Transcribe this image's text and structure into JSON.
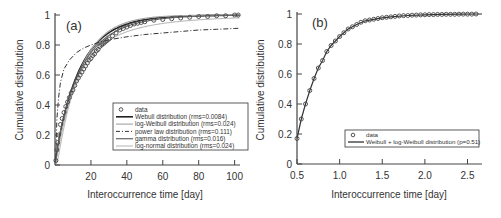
{
  "chart_data": [
    {
      "panel": "(a)",
      "type": "line",
      "xlabel": "Interoccurrence time [day]",
      "ylabel": "Cumulative distribution",
      "xlim": [
        0,
        103
      ],
      "ylim": [
        0,
        1
      ],
      "xticks": [
        20,
        40,
        60,
        80,
        100
      ],
      "yticks": [
        0,
        0.2,
        0.4,
        0.6,
        0.8,
        1
      ],
      "ytick_labels": [
        "0",
        "0.2",
        "0.4",
        "0.6",
        "0.8",
        "1"
      ],
      "grid": false,
      "legend_position": "lower right",
      "legend": [
        {
          "label": "data",
          "style": "circle"
        },
        {
          "label": "Webull distribution (rms=0.0084)",
          "style": "solid-dark"
        },
        {
          "label": "log-Weibull distribution (rms=0.024)",
          "style": "solid-light"
        },
        {
          "label": "power law distribution (rms=0.111)",
          "style": "dashdot"
        },
        {
          "label": "gamma distribution (rms=0.016)",
          "style": "solid-mid"
        },
        {
          "label": "log-normal distribution (rms=0.024)",
          "style": "solid-pale"
        }
      ],
      "series": [
        {
          "name": "data",
          "x": [
            0.5,
            1,
            1.5,
            2,
            3,
            4,
            5,
            6,
            7,
            8,
            9,
            10,
            11,
            12,
            13,
            14,
            15,
            16,
            17,
            18,
            19,
            20,
            21,
            22,
            23,
            24,
            25,
            26,
            27,
            28,
            29,
            30,
            32,
            34,
            36,
            38,
            40,
            42,
            44,
            46,
            48,
            50,
            55,
            60,
            65,
            70,
            75,
            80,
            85,
            90,
            95,
            100,
            102
          ],
          "y": [
            0.03,
            0.1,
            0.15,
            0.2,
            0.27,
            0.31,
            0.35,
            0.39,
            0.42,
            0.45,
            0.48,
            0.5,
            0.53,
            0.56,
            0.58,
            0.6,
            0.62,
            0.64,
            0.66,
            0.68,
            0.7,
            0.71,
            0.73,
            0.74,
            0.76,
            0.77,
            0.79,
            0.8,
            0.81,
            0.82,
            0.83,
            0.84,
            0.86,
            0.88,
            0.9,
            0.91,
            0.92,
            0.93,
            0.94,
            0.945,
            0.95,
            0.955,
            0.965,
            0.97,
            0.975,
            0.98,
            0.985,
            0.99,
            0.99,
            0.995,
            0.995,
            1.0,
            1.0
          ]
        },
        {
          "name": "Webull distribution (rms=0.0084)",
          "shape": 0.95,
          "scale": 13.5
        },
        {
          "name": "log-Weibull distribution (rms=0.024)",
          "shape": 1.05,
          "scale": 14.0
        },
        {
          "name": "power law distribution (rms=0.111)",
          "x": [
            0.5,
            1,
            2,
            3,
            5,
            8,
            12,
            16,
            20,
            25,
            30,
            40,
            50,
            60,
            70,
            80,
            90,
            100,
            103
          ],
          "y": [
            0.05,
            0.3,
            0.45,
            0.55,
            0.64,
            0.7,
            0.75,
            0.78,
            0.8,
            0.82,
            0.835,
            0.855,
            0.87,
            0.88,
            0.89,
            0.9,
            0.905,
            0.91,
            0.912
          ]
        },
        {
          "name": "gamma distribution (rms=0.016)",
          "shape": 0.9,
          "scale": 15.0
        },
        {
          "name": "log-normal distribution (rms=0.024)",
          "mu": 2.35,
          "sigma": 1.1
        }
      ]
    },
    {
      "panel": "(b)",
      "type": "line",
      "xlabel": "Interoccurrence time [day]",
      "ylabel": "Cumulative distribution",
      "xlim": [
        0.5,
        2.67
      ],
      "ylim": [
        0,
        1
      ],
      "xticks": [
        0.5,
        1.0,
        1.5,
        2.0,
        2.5
      ],
      "xtick_labels": [
        "0.5",
        "1.0",
        "1.5",
        "2.0",
        "2.5"
      ],
      "yticks": [
        0,
        0.2,
        0.4,
        0.6,
        0.8,
        1
      ],
      "ytick_labels": [
        "0",
        "0.2",
        "0.4",
        "0.6",
        "0.8",
        "1"
      ],
      "grid": false,
      "legend_position": "lower right",
      "legend": [
        {
          "label": "data",
          "style": "circle"
        },
        {
          "label": "Weibull + log-Weibull distribution (p=0.51)",
          "style": "solid-dark"
        }
      ],
      "series": [
        {
          "name": "data",
          "x": [
            0.5,
            0.55,
            0.6,
            0.65,
            0.7,
            0.75,
            0.8,
            0.85,
            0.9,
            0.95,
            1.0,
            1.05,
            1.1,
            1.15,
            1.2,
            1.25,
            1.3,
            1.35,
            1.4,
            1.45,
            1.5,
            1.55,
            1.6,
            1.65,
            1.7,
            1.75,
            1.8,
            1.85,
            1.9,
            1.95,
            2.0,
            2.05,
            2.1,
            2.15,
            2.2,
            2.25,
            2.3,
            2.35,
            2.4,
            2.45,
            2.5,
            2.55,
            2.6
          ],
          "y": [
            0.17,
            0.3,
            0.4,
            0.49,
            0.57,
            0.64,
            0.69,
            0.75,
            0.79,
            0.82,
            0.85,
            0.875,
            0.9,
            0.915,
            0.93,
            0.945,
            0.955,
            0.96,
            0.965,
            0.97,
            0.975,
            0.978,
            0.981,
            0.984,
            0.987,
            0.989,
            0.99,
            0.992,
            0.993,
            0.994,
            0.995,
            0.996,
            0.996,
            0.997,
            0.997,
            0.998,
            0.998,
            0.998,
            0.999,
            0.999,
            0.999,
            0.999,
            1.0
          ]
        },
        {
          "name": "Weibull + log-Weibull distribution (p=0.51)",
          "x": [
            0.5,
            0.55,
            0.6,
            0.65,
            0.7,
            0.75,
            0.8,
            0.85,
            0.9,
            0.95,
            1.0,
            1.1,
            1.2,
            1.3,
            1.4,
            1.5,
            1.6,
            1.8,
            2.0,
            2.2,
            2.4,
            2.67
          ],
          "y": [
            0.17,
            0.3,
            0.4,
            0.49,
            0.57,
            0.64,
            0.69,
            0.75,
            0.79,
            0.82,
            0.85,
            0.9,
            0.93,
            0.955,
            0.965,
            0.975,
            0.981,
            0.99,
            0.995,
            0.997,
            0.999,
            1.0
          ]
        }
      ]
    }
  ]
}
